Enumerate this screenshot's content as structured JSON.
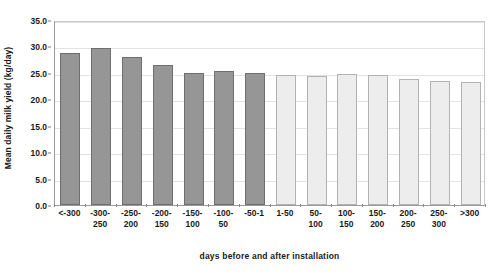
{
  "chart_data": {
    "type": "bar",
    "title": "",
    "xlabel": "days before and after installation",
    "ylabel": "Mean daily milk yield (kg/day)",
    "ylim": [
      0.0,
      35.0
    ],
    "ytick_step": 5.0,
    "ytick_labels": [
      "0.0",
      "5.0",
      "10.0",
      "15.0",
      "20.0",
      "25.0",
      "30.0",
      "35.0"
    ],
    "ytick_values": [
      0.0,
      5.0,
      10.0,
      15.0,
      20.0,
      25.0,
      30.0,
      35.0
    ],
    "grid": true,
    "legend": "none",
    "categories": [
      "<-300",
      "-300-250",
      "-250-200",
      "-200-150",
      "-150-100",
      "-100-50",
      "-50-1",
      "1-50",
      "50-100",
      "100-150",
      "150-200",
      "200-250",
      "250-300",
      ">300"
    ],
    "category_labels_lines": [
      [
        "<-300",
        ""
      ],
      [
        "-300-",
        "250"
      ],
      [
        "-250-",
        "200"
      ],
      [
        "-200-",
        "150"
      ],
      [
        "-150-",
        "100"
      ],
      [
        "-100-",
        "50"
      ],
      [
        "-50-1",
        ""
      ],
      [
        "1-50",
        ""
      ],
      [
        "50-",
        "100"
      ],
      [
        "100-",
        "150"
      ],
      [
        "150-",
        "200"
      ],
      [
        "200-",
        "250"
      ],
      [
        "250-",
        "300"
      ],
      [
        ">300",
        ""
      ]
    ],
    "values": [
      28.7,
      29.7,
      28.0,
      26.4,
      25.0,
      25.4,
      24.9,
      24.6,
      24.5,
      24.7,
      24.6,
      23.9,
      23.4,
      23.3
    ],
    "groups": [
      "before",
      "before",
      "before",
      "before",
      "before",
      "before",
      "before",
      "after",
      "after",
      "after",
      "after",
      "after",
      "after",
      "after"
    ],
    "colors": {
      "before_fill": "#969696",
      "before_border": "#6e6e6e",
      "after_fill": "#ededed",
      "after_border": "#b3b3b3",
      "gridline": "#e2e2e2",
      "axis": "#9a9a9a",
      "text": "#1a1a1a",
      "background": "#ffffff"
    }
  }
}
